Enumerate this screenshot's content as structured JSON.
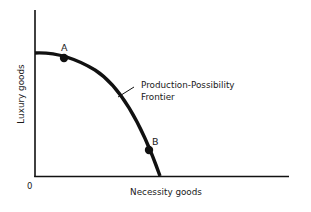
{
  "diagram": {
    "title": "Production-Possibility Frontier",
    "y_axis_label": "Luxury goods",
    "x_axis_label": "Necessity goods",
    "origin_label": "0",
    "curve_label_line1": "Production-Possibility",
    "curve_label_line2": "Frontier",
    "points": [
      {
        "label": "A"
      },
      {
        "label": "B"
      }
    ],
    "colors": {
      "ink": "#111111",
      "background": "#ffffff"
    }
  }
}
